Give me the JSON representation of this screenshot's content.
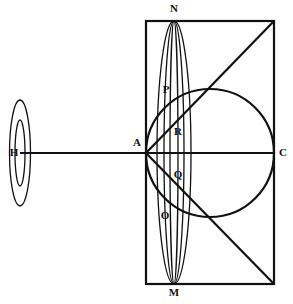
{
  "figure": {
    "background": "#ffffff",
    "stroke_color": "#111111",
    "canvas": {
      "width": 293,
      "height": 304
    }
  },
  "labels": {
    "N": "N",
    "P": "P",
    "R": "R",
    "A": "A",
    "Q": "Q",
    "O": "O",
    "M": "M",
    "H": "H",
    "C": "C"
  },
  "points": {
    "N": {
      "x": 174,
      "y": 21,
      "label_x": 174,
      "label_y": 12
    },
    "M": {
      "x": 174,
      "y": 284,
      "label_x": 174,
      "label_y": 296
    },
    "A": {
      "x": 146,
      "y": 153,
      "label_x": 137,
      "label_y": 146
    },
    "C": {
      "x": 274,
      "y": 153,
      "label_x": 283,
      "label_y": 156
    },
    "H": {
      "x": 20,
      "y": 153,
      "label_x": 14,
      "label_y": 156
    },
    "P": {
      "x": 172,
      "y": 100,
      "label_x": 166,
      "label_y": 93
    },
    "R": {
      "x": 178,
      "y": 140,
      "label_x": 178,
      "label_y": 135
    },
    "Q": {
      "x": 178,
      "y": 172,
      "label_x": 178,
      "label_y": 178
    },
    "O": {
      "x": 170,
      "y": 210,
      "label_x": 165,
      "label_y": 219
    }
  },
  "shapes": {
    "rectangle": {
      "x": 146,
      "y": 21,
      "width": 128,
      "height": 263,
      "stroke_width": 2.2
    },
    "circle": {
      "cx": 210,
      "cy": 153,
      "r": 64,
      "stroke_width": 2.2
    },
    "axis_line": {
      "x1": 20,
      "y1": 153,
      "x2": 274,
      "y2": 153,
      "stroke_width": 2.2
    },
    "diagonal_upper": {
      "x1": 146,
      "y1": 153,
      "x2": 274,
      "y2": 21,
      "stroke_width": 2.2
    },
    "diagonal_lower": {
      "x1": 146,
      "y1": 153,
      "x2": 274,
      "y2": 284,
      "stroke_width": 2.2
    },
    "ellipses_main": [
      {
        "name": "ellipse-outer-NM",
        "cx": 174,
        "cy": 152.5,
        "rx": 17,
        "ry": 131.5,
        "stroke_width": 1.3
      },
      {
        "name": "ellipse-middle-NM",
        "cx": 174,
        "cy": 152.5,
        "rx": 10,
        "ry": 131.5,
        "stroke_width": 1.3
      },
      {
        "name": "ellipse-inner-NM",
        "cx": 174,
        "cy": 152.5,
        "rx": 4,
        "ry": 131.5,
        "stroke_width": 1.3
      }
    ],
    "ellipses_left": [
      {
        "name": "ellipse-outer-H",
        "cx": 20,
        "cy": 153,
        "rx": 10.5,
        "ry": 53,
        "stroke_width": 1.3
      },
      {
        "name": "ellipse-inner-H",
        "cx": 20,
        "cy": 153,
        "rx": 5,
        "ry": 33,
        "stroke_width": 1.3
      }
    ]
  }
}
